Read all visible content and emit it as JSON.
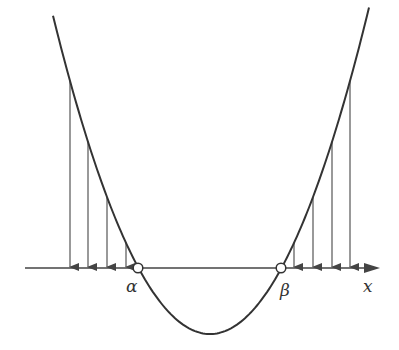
{
  "diagram": {
    "type": "parabola-with-projections",
    "curve": "parabola opening upward crossing x-axis at two points",
    "axis_label": "x",
    "roots": [
      {
        "label": "α",
        "x": 138
      },
      {
        "label": "β",
        "x": 281
      }
    ],
    "vertex": {
      "x": 210,
      "y": 334
    },
    "axis_y": 268,
    "left_arrows_x": [
      70,
      88,
      107,
      126
    ],
    "right_arrows_x": [
      294,
      313,
      332,
      350
    ],
    "colors": {
      "curve": "#333333",
      "arrows": "#555555",
      "axis": "#444444"
    }
  }
}
